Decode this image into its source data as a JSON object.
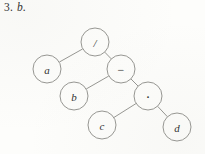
{
  "caption": {
    "number": "3.",
    "part": "b."
  },
  "figure": {
    "type": "expression-tree",
    "nodes": [
      {
        "id": "root",
        "label": "/",
        "kind": "operator",
        "cx": 95,
        "cy": 42,
        "r": 14
      },
      {
        "id": "a",
        "label": "a",
        "kind": "operand",
        "cx": 47,
        "cy": 69,
        "r": 14
      },
      {
        "id": "minus",
        "label": "−",
        "kind": "operator",
        "cx": 121,
        "cy": 69,
        "r": 14
      },
      {
        "id": "b",
        "label": "b",
        "kind": "operand",
        "cx": 74,
        "cy": 96,
        "r": 14
      },
      {
        "id": "dot",
        "label": "·",
        "kind": "operator",
        "cx": 148,
        "cy": 96,
        "r": 14
      },
      {
        "id": "c",
        "label": "c",
        "kind": "operand",
        "cx": 102,
        "cy": 125,
        "r": 14
      },
      {
        "id": "d",
        "label": "d",
        "kind": "operand",
        "cx": 177,
        "cy": 127,
        "r": 14
      }
    ],
    "edges": [
      {
        "from": "root",
        "to": "a"
      },
      {
        "from": "root",
        "to": "minus"
      },
      {
        "from": "minus",
        "to": "b"
      },
      {
        "from": "minus",
        "to": "dot"
      },
      {
        "from": "dot",
        "to": "c"
      },
      {
        "from": "dot",
        "to": "d"
      }
    ],
    "colors": {
      "paper": "#fdfdfb",
      "ink": "#2f2f2f",
      "stroke": "#8a8a86"
    }
  }
}
